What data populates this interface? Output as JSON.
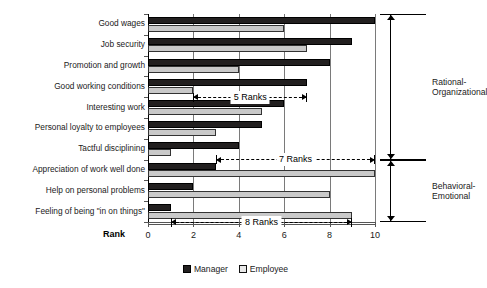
{
  "chart_data": {
    "type": "bar",
    "orientation": "horizontal",
    "title": "",
    "xlabel": "Rank",
    "ylabel": "",
    "xlim": [
      0,
      10
    ],
    "xticks": [
      0,
      2,
      4,
      6,
      8,
      10
    ],
    "grid": true,
    "legend_position": "bottom",
    "categories": [
      "Good wages",
      "Job security",
      "Promotion and growth",
      "Good working conditions",
      "Interesting work",
      "Personal loyalty to employees",
      "Tactful disciplining",
      "Appreciation of work well done",
      "Help on personal problems",
      "Feeling of being \"in on things\""
    ],
    "series": [
      {
        "name": "Manager",
        "color": "#221f1f",
        "values": [
          10,
          9,
          8,
          7,
          6,
          5,
          4,
          3,
          2,
          1
        ]
      },
      {
        "name": "Employee",
        "color": "#c9c9c9",
        "values": [
          6,
          7,
          4,
          2,
          5,
          3,
          1,
          10,
          8,
          9
        ]
      }
    ],
    "annotations": [
      {
        "label": "5 Ranks",
        "row": 3,
        "from": 2,
        "to": 7
      },
      {
        "label": "7 Ranks",
        "row": 6,
        "from": 3,
        "to": 10
      },
      {
        "label": "8 Ranks",
        "row": 9,
        "from": 1,
        "to": 9
      }
    ],
    "brackets": [
      {
        "label_line1": "Rational-",
        "label_line2": "Organizational",
        "from_row": 0,
        "to_row": 6
      },
      {
        "label_line1": "Behavioral-",
        "label_line2": "Emotional",
        "from_row": 7,
        "to_row": 9
      }
    ]
  }
}
